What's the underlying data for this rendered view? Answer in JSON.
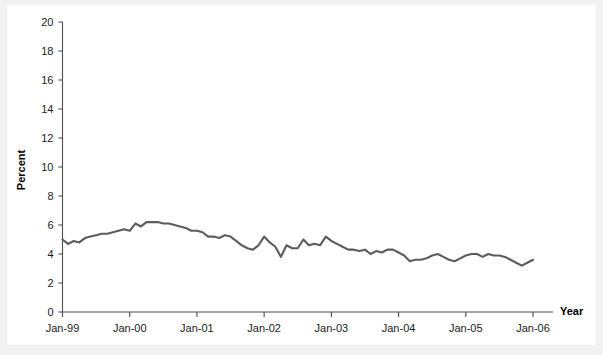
{
  "chart_data": {
    "type": "line",
    "title": "",
    "xlabel": "Year",
    "ylabel": "Percent",
    "ylim": [
      0,
      20
    ],
    "ytick_step": 2,
    "yticks": [
      "0",
      "2",
      "4",
      "6",
      "8",
      "10",
      "12",
      "14",
      "16",
      "18",
      "20"
    ],
    "xticks": [
      "Jan-99",
      "Jan-00",
      "Jan-01",
      "Jan-02",
      "Jan-03",
      "Jan-04",
      "Jan-05",
      "Jan-06"
    ],
    "xlim": [
      "Jan-99",
      "Jan-06"
    ],
    "grid": false,
    "legend": "none",
    "line_color": "#5c5c5c",
    "axis_color": "#4d4d4d",
    "background_color": "#ffffff",
    "series": [
      {
        "name": "Percent",
        "x": [
          "Jan-99",
          "Feb-99",
          "Mar-99",
          "Apr-99",
          "May-99",
          "Jun-99",
          "Jul-99",
          "Aug-99",
          "Sep-99",
          "Oct-99",
          "Nov-99",
          "Dec-99",
          "Jan-00",
          "Feb-00",
          "Mar-00",
          "Apr-00",
          "May-00",
          "Jun-00",
          "Jul-00",
          "Aug-00",
          "Sep-00",
          "Oct-00",
          "Nov-00",
          "Dec-00",
          "Jan-01",
          "Feb-01",
          "Mar-01",
          "Apr-01",
          "May-01",
          "Jun-01",
          "Jul-01",
          "Aug-01",
          "Sep-01",
          "Oct-01",
          "Nov-01",
          "Dec-01",
          "Jan-02",
          "Feb-02",
          "Mar-02",
          "Apr-02",
          "May-02",
          "Jun-02",
          "Jul-02",
          "Aug-02",
          "Sep-02",
          "Oct-02",
          "Nov-02",
          "Dec-02",
          "Jan-03",
          "Feb-03",
          "Mar-03",
          "Apr-03",
          "May-03",
          "Jun-03",
          "Jul-03",
          "Aug-03",
          "Sep-03",
          "Oct-03",
          "Nov-03",
          "Dec-03",
          "Jan-04",
          "Feb-04",
          "Mar-04",
          "Apr-04",
          "May-04",
          "Jun-04",
          "Jul-04",
          "Aug-04",
          "Sep-04",
          "Oct-04",
          "Nov-04",
          "Dec-04",
          "Jan-05",
          "Feb-05",
          "Mar-05",
          "Apr-05",
          "May-05",
          "Jun-05",
          "Jul-05",
          "Aug-05",
          "Sep-05",
          "Oct-05",
          "Nov-05",
          "Dec-05",
          "Jan-06"
        ],
        "values": [
          5.0,
          4.7,
          4.9,
          4.8,
          5.1,
          5.2,
          5.3,
          5.4,
          5.4,
          5.5,
          5.6,
          5.7,
          5.6,
          6.1,
          5.9,
          6.2,
          6.2,
          6.2,
          6.1,
          6.1,
          6.0,
          5.9,
          5.8,
          5.6,
          5.6,
          5.5,
          5.2,
          5.2,
          5.1,
          5.3,
          5.2,
          4.9,
          4.6,
          4.4,
          4.3,
          4.6,
          5.2,
          4.8,
          4.5,
          3.8,
          4.6,
          4.4,
          4.4,
          5.0,
          4.6,
          4.7,
          4.6,
          5.2,
          4.9,
          4.7,
          4.5,
          4.3,
          4.3,
          4.2,
          4.3,
          4.0,
          4.2,
          4.1,
          4.3,
          4.3,
          4.1,
          3.9,
          3.5,
          3.6,
          3.6,
          3.7,
          3.9,
          4.0,
          3.8,
          3.6,
          3.5,
          3.7,
          3.9,
          4.0,
          4.0,
          3.8,
          4.0,
          3.9,
          3.9,
          3.8,
          3.6,
          3.4,
          3.2,
          3.4,
          3.6
        ]
      }
    ]
  },
  "axes": {
    "y_axis_title": "Percent",
    "x_axis_title": "Year"
  }
}
